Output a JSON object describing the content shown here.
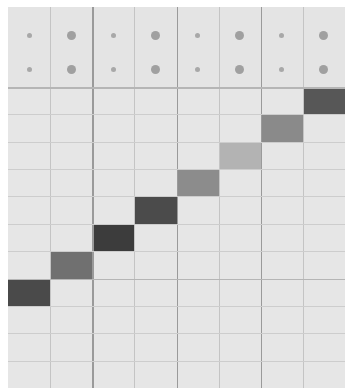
{
  "sequencer": {
    "columns": 8,
    "rows": 11,
    "header_rows": 2,
    "background": "#e6e6e6",
    "header_dots": [
      {
        "row": 0,
        "sizes": [
          "small",
          "big",
          "small",
          "big",
          "small",
          "big",
          "small",
          "big"
        ]
      },
      {
        "row": 1,
        "sizes": [
          "small",
          "big",
          "small",
          "big",
          "small",
          "big",
          "small",
          "big"
        ]
      }
    ],
    "active_cells": [
      {
        "col": 7,
        "row": 0,
        "color": "#575757"
      },
      {
        "col": 6,
        "row": 1,
        "color": "#8a8a8a"
      },
      {
        "col": 5,
        "row": 2,
        "color": "#b3b3b3"
      },
      {
        "col": 4,
        "row": 3,
        "color": "#8c8c8c"
      },
      {
        "col": 3,
        "row": 4,
        "color": "#4b4b4b"
      },
      {
        "col": 2,
        "row": 5,
        "color": "#3c3c3c"
      },
      {
        "col": 1,
        "row": 6,
        "color": "#707070"
      },
      {
        "col": 0,
        "row": 7,
        "color": "#4a4a4a"
      }
    ]
  }
}
